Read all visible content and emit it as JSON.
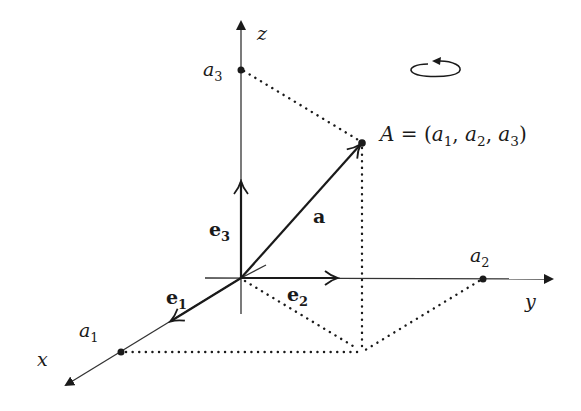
{
  "diagram": {
    "type": "3d-coordinate-system",
    "colors": {
      "stroke": "#1a1a1a",
      "axis": "#333333",
      "background": "#ffffff"
    },
    "origin": {
      "x": 241,
      "y": 278
    },
    "axes": [
      {
        "name": "x",
        "label": "x",
        "tip": {
          "x": 62,
          "y": 387
        }
      },
      {
        "name": "y",
        "label": "y",
        "tip": {
          "x": 556,
          "y": 279
        }
      },
      {
        "name": "z",
        "label": "z",
        "tip": {
          "x": 241,
          "y": 15
        }
      }
    ],
    "basis_vectors": [
      {
        "name": "e1",
        "label": "e",
        "subscript": "1",
        "tip": {
          "x": 170,
          "y": 322
        }
      },
      {
        "name": "e2",
        "label": "e",
        "subscript": "2",
        "tip": {
          "x": 338,
          "y": 278
        }
      },
      {
        "name": "e3",
        "label": "e",
        "subscript": "3",
        "tip": {
          "x": 241,
          "y": 181
        }
      }
    ],
    "vector_a": {
      "label": "a",
      "tip": {
        "x": 362,
        "y": 143
      }
    },
    "points": {
      "a1": {
        "label": "a",
        "subscript": "1",
        "x": 121,
        "y": 352
      },
      "a2": {
        "label": "a",
        "subscript": "2",
        "x": 483,
        "y": 279
      },
      "a3": {
        "label": "a",
        "subscript": "3",
        "x": 241,
        "y": 70
      },
      "A": {
        "x": 362,
        "y": 143
      },
      "foot": {
        "x": 361,
        "y": 352
      }
    },
    "point_A_label": {
      "name": "A",
      "equals": " = (",
      "c1": "a",
      "s1": "1",
      "sep1": ", ",
      "c2": "a",
      "s2": "2",
      "sep2": ", ",
      "c3": "a",
      "s3": "3",
      "close": ")"
    },
    "rotation_icon": "counterclockwise-rotation-arrow"
  }
}
